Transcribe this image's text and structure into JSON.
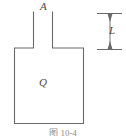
{
  "figure": {
    "kind": "engineering-dimension-diagram",
    "background_color": "#ffffff",
    "line_color": "#6a6a6a",
    "label_color": "#4a4a4a",
    "caption": "图 10-4",
    "labels": {
      "neck_area": "A",
      "body_heat": "Q",
      "neck_length": "L"
    },
    "geometry": {
      "vessel_body": {
        "x": 14,
        "y": 48,
        "width": 70,
        "height": 76
      },
      "neck": {
        "left_x": 33,
        "right_x": 52,
        "top_y": 12,
        "bottom_y": 48
      },
      "dimension_line": {
        "x": 110,
        "top_y": 13,
        "bottom_y": 49,
        "extension_left_x": 97,
        "extension_right_x": 122
      }
    }
  }
}
